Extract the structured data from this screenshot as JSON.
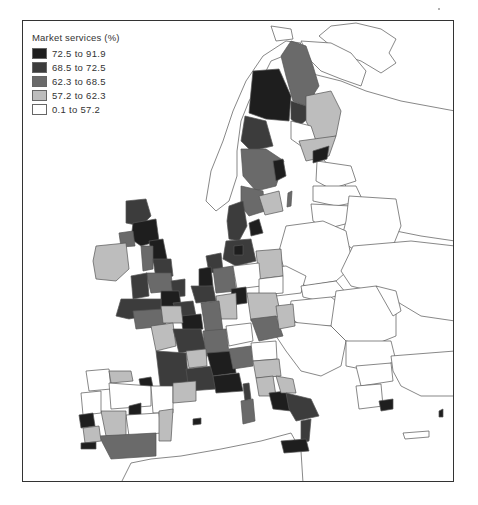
{
  "legend": {
    "title": "Market services (%)",
    "classes": [
      {
        "label": "72.5 to 91.9",
        "color": "#1e1e1e"
      },
      {
        "label": "68.5 to 72.5",
        "color": "#3c3c3c"
      },
      {
        "label": "62.3 to 68.5",
        "color": "#6a6a6a"
      },
      {
        "label": "57.2 to 62.3",
        "color": "#bdbdbd"
      },
      {
        "label": "0.1 to 57.2",
        "color": "#ffffff"
      }
    ]
  },
  "colors": {
    "border": "#555555",
    "nodata": "#ffffff"
  }
}
